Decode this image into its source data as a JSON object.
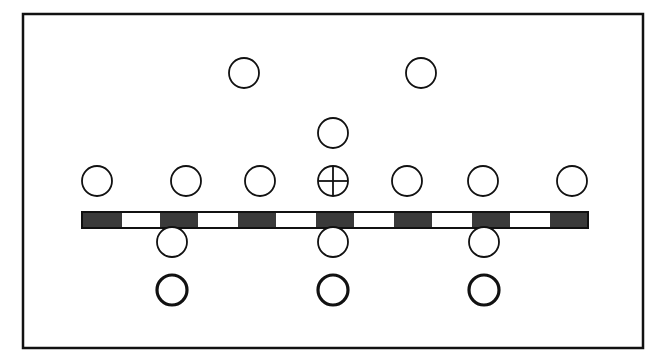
{
  "diagram": {
    "type": "formation-layout",
    "frame": {
      "x": 23,
      "y": 14,
      "width": 620,
      "height": 334,
      "stroke": "#111111",
      "stroke_width": 2.5
    },
    "bar": {
      "x": 82,
      "y": 212,
      "width": 506,
      "height": 16,
      "segments": [
        {
          "fill": "#3a3a3a",
          "w": 40
        },
        {
          "fill": "#ffffff",
          "w": 38
        },
        {
          "fill": "#3a3a3a",
          "w": 38
        },
        {
          "fill": "#ffffff",
          "w": 40
        },
        {
          "fill": "#3a3a3a",
          "w": 38
        },
        {
          "fill": "#ffffff",
          "w": 40
        },
        {
          "fill": "#3a3a3a",
          "w": 38
        },
        {
          "fill": "#ffffff",
          "w": 40
        },
        {
          "fill": "#3a3a3a",
          "w": 38
        },
        {
          "fill": "#ffffff",
          "w": 40
        },
        {
          "fill": "#3a3a3a",
          "w": 38
        },
        {
          "fill": "#ffffff",
          "w": 40
        },
        {
          "fill": "#3a3a3a",
          "w": 38
        }
      ]
    },
    "markers": [
      {
        "id": "top-left",
        "cx": 244,
        "cy": 73,
        "r": 15,
        "style": "thin"
      },
      {
        "id": "top-right",
        "cx": 421,
        "cy": 73,
        "r": 15,
        "style": "thin"
      },
      {
        "id": "middle",
        "cx": 333,
        "cy": 133,
        "r": 15,
        "style": "thin"
      },
      {
        "id": "row1-1",
        "cx": 97,
        "cy": 181,
        "r": 15,
        "style": "thin"
      },
      {
        "id": "row1-2",
        "cx": 186,
        "cy": 181,
        "r": 15,
        "style": "thin"
      },
      {
        "id": "row1-3",
        "cx": 260,
        "cy": 181,
        "r": 15,
        "style": "thin"
      },
      {
        "id": "row1-center",
        "cx": 333,
        "cy": 181,
        "r": 15,
        "style": "crosshair"
      },
      {
        "id": "row1-5",
        "cx": 407,
        "cy": 181,
        "r": 15,
        "style": "thin"
      },
      {
        "id": "row1-6",
        "cx": 483,
        "cy": 181,
        "r": 15,
        "style": "thin"
      },
      {
        "id": "row1-7",
        "cx": 572,
        "cy": 181,
        "r": 15,
        "style": "thin"
      },
      {
        "id": "row2-1",
        "cx": 172,
        "cy": 242,
        "r": 15,
        "style": "thin"
      },
      {
        "id": "row2-2",
        "cx": 333,
        "cy": 242,
        "r": 15,
        "style": "thin"
      },
      {
        "id": "row2-3",
        "cx": 484,
        "cy": 242,
        "r": 15,
        "style": "thin"
      },
      {
        "id": "row3-1",
        "cx": 172,
        "cy": 290,
        "r": 15,
        "style": "thick"
      },
      {
        "id": "row3-2",
        "cx": 333,
        "cy": 290,
        "r": 15,
        "style": "thick"
      },
      {
        "id": "row3-3",
        "cx": 484,
        "cy": 290,
        "r": 15,
        "style": "thick"
      }
    ],
    "colors": {
      "stroke": "#111111",
      "background": "#ffffff",
      "bar_dark": "#3a3a3a"
    }
  }
}
